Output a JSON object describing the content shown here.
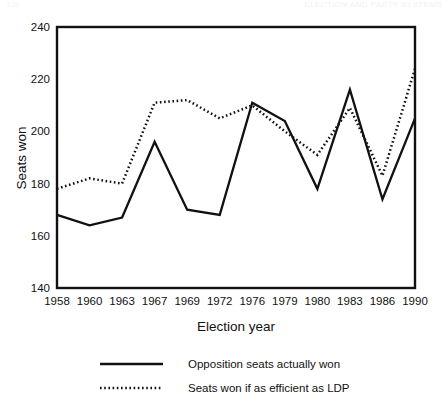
{
  "ghost_header": {
    "right_text": "ELECTION AND PARTY SYSTEMS",
    "left_text": "136"
  },
  "chart_data": {
    "type": "line",
    "title": "",
    "xlabel": "Election year",
    "ylabel": "Seats won",
    "categories": [
      "1958",
      "1960",
      "1963",
      "1967",
      "1969",
      "1972",
      "1976",
      "1979",
      "1980",
      "1983",
      "1986",
      "1990"
    ],
    "ylim": [
      140,
      240
    ],
    "yticks": [
      140,
      160,
      180,
      200,
      220,
      240
    ],
    "grid": false,
    "legend_position": "bottom",
    "series": [
      {
        "name": "Opposition seats actually won",
        "style": "solid",
        "color": "#111111",
        "values": [
          168,
          164,
          167,
          196,
          170,
          168,
          211,
          204,
          178,
          216,
          174,
          205
        ]
      },
      {
        "name": "Seats won if as efficient as LDP",
        "style": "dotted",
        "color": "#111111",
        "values": [
          178,
          182,
          180,
          211,
          212,
          205,
          210,
          200,
          191,
          209,
          183,
          224
        ]
      }
    ]
  }
}
